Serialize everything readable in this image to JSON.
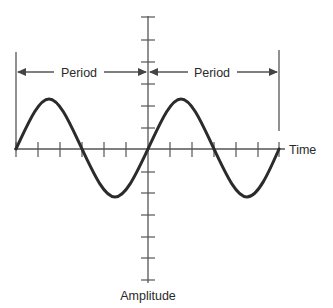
{
  "diagram": {
    "type": "sine-wave-period-illustration",
    "labels": {
      "period_left": "Period",
      "period_right": "Period",
      "x_axis": "Time",
      "y_axis": "Amplitude"
    },
    "wave": {
      "cycles": 2,
      "shape": "sine",
      "start_phase": "zero-crossing rising"
    },
    "x_axis": {
      "tick_count_per_period": 6
    },
    "y_axis": {
      "ticks_above": 6,
      "ticks_below": 6
    },
    "colors": {
      "wave": "#2b2b2b",
      "axis": "#555555",
      "text": "#2a2a2a",
      "background": "#ffffff"
    }
  }
}
